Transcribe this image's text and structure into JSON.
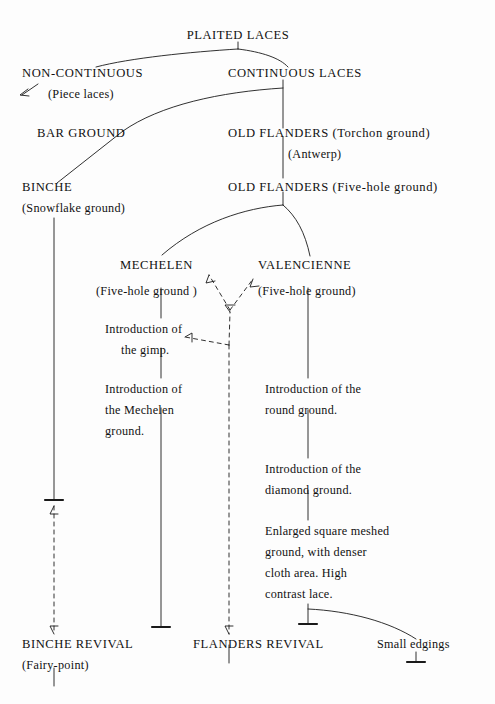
{
  "diagram": {
    "title": "PLAITED LACES",
    "type": "genealogy-tree",
    "background_color": "#fdfdfd",
    "line_color": "#1a1a1a",
    "nodes": {
      "plaited_laces": "PLAITED LACES",
      "non_continuous": "NON-CONTINUOUS",
      "non_continuous_sub": "(Piece laces)",
      "continuous_laces": "CONTINUOUS LACES",
      "bar_ground": "BAR GROUND",
      "old_flanders_torchon": "OLD FLANDERS (Torchon ground)",
      "antwerp": "(Antwerp)",
      "binche": "BINCHE",
      "binche_sub": "(Snowflake ground)",
      "old_flanders_five_hole": "OLD FLANDERS (Five-hole ground)",
      "mechelen": "MECHELEN",
      "mechelen_sub": "(Five-hole ground )",
      "valencienne": "VALENCIENNE",
      "valencienne_sub": "(Five-hole ground)",
      "intro_gimp": "Introduction of\nthe gimp.",
      "intro_mechelen_ground": "Introduction of\nthe Mechelen\nground.",
      "intro_round_ground": "Introduction of the\nround ground.",
      "intro_diamond_ground": "Introduction of the\ndiamond ground.",
      "enlarged_square": "Enlarged square meshed\nground, with denser\ncloth area. High\ncontrast lace.",
      "binche_revival": "BINCHE REVIVAL",
      "binche_revival_sub": "(Fairy-point)",
      "flanders_revival": "FLANDERS REVIVAL",
      "small_edgings": "Small edgings"
    },
    "lines": {
      "intro_gimp_l1": "Introduction of",
      "intro_gimp_l2": "the gimp.",
      "intro_mech_l1": "Introduction of",
      "intro_mech_l2": "the Mechelen",
      "intro_mech_l3": "ground.",
      "intro_round_l1": "Introduction of the",
      "intro_round_l2": "round ground.",
      "intro_diamond_l1": "Introduction of the",
      "intro_diamond_l2": "diamond ground.",
      "enlarged_l1": "Enlarged square meshed",
      "enlarged_l2": "ground, with denser",
      "enlarged_l3": "cloth area. High",
      "enlarged_l4": "contrast lace."
    }
  }
}
